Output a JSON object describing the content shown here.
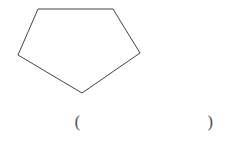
{
  "figure": {
    "shape": "pentagon",
    "stroke_color": "#444444",
    "fill_color": "#ffffff",
    "vertices": [
      [
        38,
        9
      ],
      [
        113,
        9
      ],
      [
        140,
        53
      ],
      [
        82,
        93
      ],
      [
        18,
        55
      ]
    ],
    "vertices_str": "38,9 113,9 140,53 82,93 18,55"
  },
  "answer": {
    "open_paren": "(",
    "close_paren": ")",
    "value": ""
  }
}
